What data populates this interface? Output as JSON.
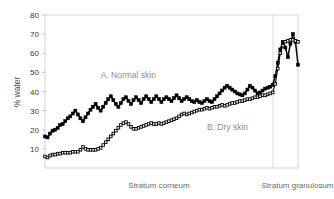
{
  "chart_data": {
    "type": "line",
    "title": "",
    "subtitle": "",
    "xlabel": "",
    "ylabel": "% water",
    "ylim": [
      0,
      80
    ],
    "ytick_labels": [
      "10",
      "20",
      "30",
      "40",
      "50",
      "60",
      "70",
      "80"
    ],
    "ytick_values": [
      10,
      20,
      30,
      40,
      50,
      60,
      70,
      80
    ],
    "grid": false,
    "legend_position": "inline-annotation",
    "xlim": [
      0,
      100
    ],
    "x_category_labels": [
      "Stratum corneum",
      "Stratum granulosum"
    ],
    "x_divider_value": 90,
    "annotations": [
      {
        "text": "A. Normal skin",
        "x": 22,
        "y": 47
      },
      {
        "text": "B. Dry skin",
        "x": 64,
        "y": 20
      }
    ],
    "series": [
      {
        "name": "A. Normal skin",
        "label": "A. Normal skin",
        "marker": "filled-square",
        "color": "#000000",
        "x": [
          0.0,
          1.0,
          2.0,
          3.0,
          4.0,
          5.0,
          6.0,
          7.0,
          8.0,
          9.0,
          10.0,
          11.0,
          12.0,
          13.0,
          14.0,
          15.0,
          16.0,
          17.0,
          18.0,
          19.0,
          20.0,
          21.0,
          22.0,
          23.0,
          24.0,
          25.0,
          26.0,
          27.0,
          28.0,
          29.0,
          30.0,
          31.0,
          32.0,
          33.0,
          34.0,
          35.0,
          36.0,
          37.0,
          38.0,
          39.0,
          40.0,
          41.0,
          42.0,
          43.0,
          44.0,
          45.0,
          46.0,
          47.0,
          48.0,
          49.0,
          50.0,
          51.0,
          52.0,
          53.0,
          54.0,
          55.0,
          56.0,
          57.0,
          58.0,
          59.0,
          60.0,
          61.0,
          62.0,
          63.0,
          64.0,
          65.0,
          66.0,
          67.0,
          68.0,
          69.0,
          70.0,
          71.0,
          72.0,
          73.0,
          74.0,
          75.0,
          76.0,
          77.0,
          78.0,
          79.0,
          80.0,
          81.0,
          82.0,
          83.0,
          84.0,
          85.0,
          86.0,
          87.0,
          88.0,
          89.0,
          90.0,
          91.0,
          92.0,
          93.0,
          94.0,
          95.0,
          96.0,
          97.0,
          98.0,
          99.0,
          100.0
        ],
        "values": [
          16.5,
          16.0,
          18.0,
          19.5,
          20.0,
          21.0,
          22.5,
          23.0,
          24.5,
          26.0,
          27.0,
          28.5,
          30.0,
          28.0,
          26.0,
          24.5,
          26.5,
          28.5,
          30.5,
          32.0,
          33.5,
          31.5,
          30.0,
          32.0,
          34.0,
          36.0,
          37.5,
          35.5,
          33.5,
          32.0,
          34.0,
          36.0,
          37.0,
          35.0,
          33.5,
          35.5,
          37.0,
          35.5,
          34.0,
          36.0,
          37.5,
          36.0,
          34.5,
          36.0,
          37.5,
          36.0,
          34.5,
          36.0,
          37.0,
          36.0,
          35.0,
          36.5,
          38.0,
          36.5,
          35.0,
          36.0,
          37.0,
          36.0,
          35.0,
          34.5,
          35.5,
          34.5,
          34.0,
          35.0,
          36.0,
          35.0,
          34.5,
          36.0,
          37.5,
          39.0,
          40.5,
          42.0,
          43.0,
          42.0,
          41.0,
          40.0,
          39.0,
          38.5,
          38.0,
          39.0,
          41.0,
          43.0,
          42.0,
          40.5,
          39.0,
          39.5,
          40.5,
          41.5,
          42.0,
          42.5,
          43.5,
          48.0,
          55.0,
          62.0,
          66.0,
          63.0,
          58.0,
          65.0,
          70.0,
          66.0,
          54.0
        ]
      },
      {
        "name": "B. Dry skin",
        "label": "B. Dry skin",
        "marker": "open-square",
        "color": "#000000",
        "x": [
          0.0,
          1.0,
          2.0,
          3.0,
          4.0,
          5.0,
          6.0,
          7.0,
          8.0,
          9.0,
          10.0,
          11.0,
          12.0,
          13.0,
          14.0,
          15.0,
          16.0,
          17.0,
          18.0,
          19.0,
          20.0,
          21.0,
          22.0,
          23.0,
          24.0,
          25.0,
          26.0,
          27.0,
          28.0,
          29.0,
          30.0,
          31.0,
          32.0,
          33.0,
          34.0,
          35.0,
          36.0,
          37.0,
          38.0,
          39.0,
          40.0,
          41.0,
          42.0,
          43.0,
          44.0,
          45.0,
          46.0,
          47.0,
          48.0,
          49.0,
          50.0,
          51.0,
          52.0,
          53.0,
          54.0,
          55.0,
          56.0,
          57.0,
          58.0,
          59.0,
          60.0,
          61.0,
          62.0,
          63.0,
          64.0,
          65.0,
          66.0,
          67.0,
          68.0,
          69.0,
          70.0,
          71.0,
          72.0,
          73.0,
          74.0,
          75.0,
          76.0,
          77.0,
          78.0,
          79.0,
          80.0,
          81.0,
          82.0,
          83.0,
          84.0,
          85.0,
          86.0,
          87.0,
          88.0,
          89.0,
          90.0,
          91.0,
          92.0,
          93.0,
          94.0,
          95.0,
          96.0,
          97.0,
          98.0,
          99.0,
          100.0
        ],
        "values": [
          6.0,
          5.5,
          6.5,
          7.0,
          7.0,
          7.5,
          7.5,
          8.0,
          8.0,
          8.0,
          8.0,
          8.5,
          8.5,
          8.5,
          9.5,
          11.0,
          10.0,
          9.5,
          9.5,
          9.5,
          9.5,
          10.0,
          10.5,
          12.0,
          13.5,
          15.0,
          16.5,
          18.0,
          19.5,
          21.0,
          22.5,
          23.5,
          24.0,
          23.0,
          21.5,
          20.5,
          20.5,
          21.0,
          21.5,
          22.0,
          22.5,
          23.0,
          23.5,
          23.0,
          23.0,
          23.5,
          23.0,
          23.5,
          24.0,
          24.5,
          25.0,
          25.5,
          26.0,
          27.0,
          28.0,
          28.5,
          28.0,
          28.5,
          29.0,
          29.5,
          30.0,
          30.5,
          30.5,
          31.0,
          31.5,
          31.0,
          31.5,
          32.0,
          32.0,
          32.5,
          33.0,
          32.5,
          33.0,
          33.5,
          34.0,
          34.0,
          34.5,
          35.0,
          35.0,
          35.5,
          36.0,
          36.0,
          36.5,
          37.0,
          37.0,
          37.5,
          38.0,
          38.0,
          38.5,
          39.0,
          39.5,
          44.0,
          52.0,
          60.0,
          64.0,
          66.0,
          66.5,
          67.0,
          67.0,
          66.5,
          66.0
        ]
      }
    ]
  },
  "axis": {
    "y_title": "% water"
  }
}
